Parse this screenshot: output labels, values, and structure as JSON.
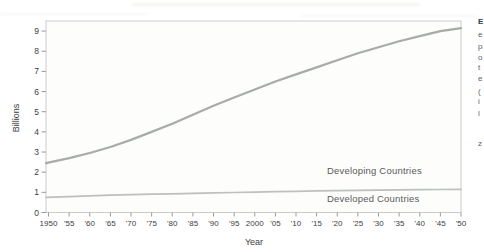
{
  "figure": {
    "name": "population-growth-chart",
    "ylabel": "Billions",
    "xlabel": "Year"
  },
  "chart_data": {
    "type": "line",
    "title": "",
    "xlabel": "Year",
    "ylabel": "Billions",
    "x": [
      1950,
      1955,
      1960,
      1965,
      1970,
      1975,
      1980,
      1985,
      1990,
      1995,
      2000,
      2005,
      2010,
      2015,
      2020,
      2025,
      2030,
      2035,
      2040,
      2045,
      2050
    ],
    "x_tick_labels": [
      "1950",
      "'55",
      "'60",
      "'65",
      "'70",
      "'75",
      "'80",
      "'85",
      "'90",
      "'95",
      "2000",
      "'05",
      "'10",
      "'15",
      "'20",
      "'25",
      "'30",
      "'35",
      "'40",
      "'45",
      "'50"
    ],
    "y_ticks": [
      0,
      1,
      2,
      3,
      4,
      5,
      6,
      7,
      8,
      9
    ],
    "ylim": [
      0,
      9.5
    ],
    "grid": false,
    "legend_position": "inline-labels-right",
    "series": [
      {
        "name": "Developing Countries",
        "color": "#a7aba9",
        "stroke_width": 2.2,
        "values": [
          2.45,
          2.7,
          2.95,
          3.25,
          3.6,
          4.0,
          4.4,
          4.85,
          5.3,
          5.7,
          6.1,
          6.5,
          6.85,
          7.2,
          7.55,
          7.9,
          8.2,
          8.5,
          8.75,
          9.0,
          9.15
        ]
      },
      {
        "name": "Developed Countries",
        "color": "#bcc0be",
        "stroke_width": 1.7,
        "values": [
          0.75,
          0.79,
          0.83,
          0.86,
          0.89,
          0.91,
          0.93,
          0.95,
          0.97,
          0.99,
          1.01,
          1.03,
          1.05,
          1.07,
          1.08,
          1.1,
          1.11,
          1.12,
          1.13,
          1.14,
          1.15
        ]
      }
    ]
  },
  "colors": {
    "plot_border": "#c9cbca",
    "plot_background": "#fdfdfc",
    "tick_mark": "#9b9b9b",
    "tick_label": "#3d3d3d",
    "axis_title": "#3d3d3d",
    "series_label": "#595959"
  },
  "scan_artifacts": {
    "caption_fragments": [
      {
        "glyph": "E",
        "top": 18,
        "bold": true
      },
      {
        "glyph": "e",
        "top": 31,
        "bold": false
      },
      {
        "glyph": "p",
        "top": 43,
        "bold": false
      },
      {
        "glyph": "o",
        "top": 54,
        "bold": false
      },
      {
        "glyph": "t",
        "top": 64,
        "bold": false
      },
      {
        "glyph": "e",
        "top": 75,
        "bold": false
      },
      {
        "glyph": "(",
        "top": 88,
        "bold": false
      },
      {
        "glyph": "i",
        "top": 98,
        "bold": false
      },
      {
        "glyph": "l",
        "top": 110,
        "bold": false
      },
      {
        "glyph": "z",
        "top": 140,
        "bold": false
      }
    ]
  }
}
